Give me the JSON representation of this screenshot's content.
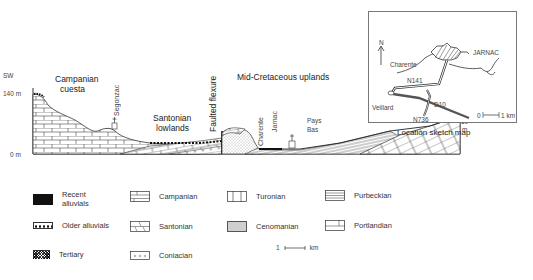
{
  "cross_section": {
    "direction_left": "SW",
    "direction_right": "NE",
    "elevation_top_left": "140 m",
    "elevation_bottom_left": "0 m",
    "elevation_right_value": "60",
    "elevation_right_unit": "m",
    "regions": {
      "campanian_cuesta_line1": "Campanian",
      "campanian_cuesta_line2": "cuesta",
      "santonian_lowlands_line1": "Santonian",
      "santonian_lowlands_line2": "lowlands",
      "faulted_flexure": "Faulted flexure",
      "mid_cretaceous_uplands": "Mid-Cretaceous uplands",
      "pays_bas_line1": "Pays",
      "pays_bas_line2": "Bas"
    },
    "places": {
      "segonzac": "Segonzac",
      "charente": "Charente",
      "jarnac": "Jarnac"
    }
  },
  "inset_map": {
    "caption": "Location sketch map",
    "north": "N",
    "river": "Charente",
    "town": "JARNAC",
    "road_n141": "N141",
    "road_n736": "N736",
    "road_d10": "D10",
    "place_veillard": "Veillard",
    "scale_start": "0",
    "scale_end": "1 km"
  },
  "legend": {
    "items": [
      {
        "label_line1": "Recent",
        "label_line2": "alluvials",
        "pattern": "solid-black"
      },
      {
        "label": "Older alluvials",
        "pattern": "dots-row"
      },
      {
        "label": "Tertiary",
        "pattern": "cross-hatch"
      },
      {
        "label": "Campanian",
        "pattern": "brick"
      },
      {
        "label": "Santonian",
        "pattern": "brick-diagonal"
      },
      {
        "label": "Coniacian",
        "pattern": "small-circles"
      },
      {
        "label": "Turonian",
        "pattern": "vertical-lines"
      },
      {
        "label": "Cenomanian",
        "pattern": "stipple"
      },
      {
        "label": "Purbeckian",
        "pattern": "horizontal-lines"
      },
      {
        "label": "Portlandian",
        "pattern": "large-blocks"
      }
    ],
    "scale_left": "1",
    "scale_unit": "km"
  },
  "colors": {
    "line": "#333333",
    "text": "#222222",
    "background": "#ffffff"
  }
}
